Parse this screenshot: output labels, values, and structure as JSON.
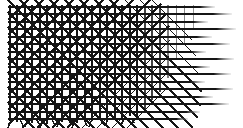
{
  "canvas": {
    "width": 243,
    "height": 128,
    "background_color": "#ffffff",
    "ink_color": "#151515",
    "fade_color": "#8e8e8e",
    "title": "Crosshatch lattice texture"
  },
  "artwork": {
    "type": "abstract-line-texture",
    "description": "Dense woven crosshatch mesh at left that progressively thins toward the right, leaving only horizontal rules that fade to grey; diagonal fringe spikes hang below the bottom edge.",
    "pattern_region": {
      "x": 8,
      "y": 5,
      "width": 228,
      "height": 116
    },
    "grid_pitch": 7.6,
    "stroke_width_heavy": 1.9,
    "stroke_width_light": 1.1,
    "density_gradient": {
      "dense_end_x": 8,
      "sparse_start_x": 120,
      "sparse_end_x": 236
    }
  },
  "chart_data": {
    "type": "line",
    "xlabel": "",
    "ylabel": "",
    "xlim": [
      0,
      243
    ],
    "ylim": [
      0,
      128
    ],
    "grid": false,
    "legend": "none",
    "horizontal_lines": [
      {
        "y": 7,
        "x_start": 8,
        "x_end": 215,
        "weight": 1.9,
        "fade_from": 176
      },
      {
        "y": 14,
        "x_start": 8,
        "x_end": 232,
        "weight": 1.9,
        "fade_from": 182
      },
      {
        "y": 22,
        "x_start": 8,
        "x_end": 208,
        "weight": 1.9,
        "fade_from": 170
      },
      {
        "y": 29,
        "x_start": 8,
        "x_end": 236,
        "weight": 1.9,
        "fade_from": 186
      },
      {
        "y": 37,
        "x_start": 8,
        "x_end": 212,
        "weight": 1.9,
        "fade_from": 172
      },
      {
        "y": 44,
        "x_start": 8,
        "x_end": 230,
        "weight": 1.9,
        "fade_from": 184
      },
      {
        "y": 52,
        "x_start": 8,
        "x_end": 206,
        "weight": 1.9,
        "fade_from": 168
      },
      {
        "y": 59,
        "x_start": 8,
        "x_end": 234,
        "weight": 1.9,
        "fade_from": 188
      },
      {
        "y": 67,
        "x_start": 8,
        "x_end": 210,
        "weight": 1.9,
        "fade_from": 172
      },
      {
        "y": 74,
        "x_start": 8,
        "x_end": 231,
        "weight": 1.9,
        "fade_from": 185
      },
      {
        "y": 82,
        "x_start": 8,
        "x_end": 205,
        "weight": 1.9,
        "fade_from": 166
      },
      {
        "y": 89,
        "x_start": 8,
        "x_end": 233,
        "weight": 1.9,
        "fade_from": 187
      },
      {
        "y": 97,
        "x_start": 8,
        "x_end": 213,
        "weight": 1.9,
        "fade_from": 174
      },
      {
        "y": 104,
        "x_start": 8,
        "x_end": 229,
        "weight": 1.9,
        "fade_from": 183
      },
      {
        "y": 112,
        "x_start": 8,
        "x_end": 200,
        "weight": 1.9,
        "fade_from": 164
      },
      {
        "y": 119,
        "x_start": 8,
        "x_end": 188,
        "weight": 1.9,
        "fade_from": 158
      }
    ],
    "vertical_lines": [
      {
        "x": 10,
        "y_start": 5,
        "y_end": 121,
        "weight": 1.9
      },
      {
        "x": 17,
        "y_start": 5,
        "y_end": 122,
        "weight": 1.9
      },
      {
        "x": 25,
        "y_start": 5,
        "y_end": 120,
        "weight": 1.9
      },
      {
        "x": 32,
        "y_start": 5,
        "y_end": 123,
        "weight": 1.9
      },
      {
        "x": 40,
        "y_start": 5,
        "y_end": 121,
        "weight": 1.9
      },
      {
        "x": 47,
        "y_start": 5,
        "y_end": 124,
        "weight": 1.9
      },
      {
        "x": 55,
        "y_start": 5,
        "y_end": 120,
        "weight": 1.9
      },
      {
        "x": 62,
        "y_start": 5,
        "y_end": 122,
        "weight": 1.9
      },
      {
        "x": 70,
        "y_start": 5,
        "y_end": 119,
        "weight": 1.9
      },
      {
        "x": 77,
        "y_start": 5,
        "y_end": 123,
        "weight": 1.9
      },
      {
        "x": 85,
        "y_start": 5,
        "y_end": 120,
        "weight": 1.9
      },
      {
        "x": 92,
        "y_start": 5,
        "y_end": 121,
        "weight": 1.9
      },
      {
        "x": 100,
        "y_start": 5,
        "y_end": 118,
        "weight": 1.9
      },
      {
        "x": 107,
        "y_start": 5,
        "y_end": 122,
        "weight": 1.9
      },
      {
        "x": 115,
        "y_start": 5,
        "y_end": 119,
        "weight": 1.8
      },
      {
        "x": 122,
        "y_start": 5,
        "y_end": 120,
        "weight": 1.8
      },
      {
        "x": 130,
        "y_start": 5,
        "y_end": 116,
        "weight": 1.6
      },
      {
        "x": 137,
        "y_start": 5,
        "y_end": 118,
        "weight": 1.6
      },
      {
        "x": 145,
        "y_start": 5,
        "y_end": 110,
        "weight": 1.4
      },
      {
        "x": 152,
        "y_start": 5,
        "y_end": 100,
        "weight": 1.3
      },
      {
        "x": 160,
        "y_start": 5,
        "y_end": 92,
        "weight": 1.2
      },
      {
        "x": 168,
        "y_start": 5,
        "y_end": 78,
        "weight": 1.1
      },
      {
        "x": 176,
        "y_start": 5,
        "y_end": 60,
        "weight": 1.0
      },
      {
        "x": 184,
        "y_start": 5,
        "y_end": 44,
        "weight": 0.9
      },
      {
        "x": 193,
        "y_start": 5,
        "y_end": 30,
        "weight": 0.8
      }
    ],
    "diagonal_down_lines": [
      {
        "x_start": 8,
        "y_start": 0,
        "length": 150,
        "weight": 1.8
      },
      {
        "x_start": 8,
        "y_start": 12,
        "length": 150,
        "weight": 1.8
      },
      {
        "x_start": 8,
        "y_start": 27,
        "length": 145,
        "weight": 1.8
      },
      {
        "x_start": 8,
        "y_start": 42,
        "length": 140,
        "weight": 1.8
      },
      {
        "x_start": 8,
        "y_start": 57,
        "length": 130,
        "weight": 1.8
      },
      {
        "x_start": 8,
        "y_start": 72,
        "length": 118,
        "weight": 1.8
      },
      {
        "x_start": 8,
        "y_start": 87,
        "length": 100,
        "weight": 1.8
      },
      {
        "x_start": 8,
        "y_start": 102,
        "length": 78,
        "weight": 1.8
      },
      {
        "x_start": 20,
        "y_start": 0,
        "length": 148,
        "weight": 1.8
      },
      {
        "x_start": 35,
        "y_start": 0,
        "length": 142,
        "weight": 1.8
      },
      {
        "x_start": 50,
        "y_start": 0,
        "length": 135,
        "weight": 1.8
      },
      {
        "x_start": 65,
        "y_start": 0,
        "length": 128,
        "weight": 1.8
      },
      {
        "x_start": 80,
        "y_start": 0,
        "length": 118,
        "weight": 1.7
      },
      {
        "x_start": 95,
        "y_start": 0,
        "length": 106,
        "weight": 1.6
      },
      {
        "x_start": 110,
        "y_start": 0,
        "length": 92,
        "weight": 1.5
      },
      {
        "x_start": 125,
        "y_start": 0,
        "length": 74,
        "weight": 1.4
      },
      {
        "x_start": 140,
        "y_start": 0,
        "length": 56,
        "weight": 1.2
      },
      {
        "x_start": 152,
        "y_start": 0,
        "length": 40,
        "weight": 1.1
      }
    ],
    "diagonal_up_lines": [
      {
        "x_start": 8,
        "y_start": 20,
        "length": 120,
        "weight": 1.7
      },
      {
        "x_start": 8,
        "y_start": 35,
        "length": 125,
        "weight": 1.7
      },
      {
        "x_start": 8,
        "y_start": 50,
        "length": 130,
        "weight": 1.7
      },
      {
        "x_start": 8,
        "y_start": 65,
        "length": 135,
        "weight": 1.7
      },
      {
        "x_start": 8,
        "y_start": 80,
        "length": 138,
        "weight": 1.7
      },
      {
        "x_start": 8,
        "y_start": 95,
        "length": 140,
        "weight": 1.7
      },
      {
        "x_start": 8,
        "y_start": 110,
        "length": 140,
        "weight": 1.7
      },
      {
        "x_start": 8,
        "y_start": 125,
        "length": 138,
        "weight": 1.7
      },
      {
        "x_start": 22,
        "y_start": 128,
        "length": 132,
        "weight": 1.7
      },
      {
        "x_start": 37,
        "y_start": 128,
        "length": 124,
        "weight": 1.6
      },
      {
        "x_start": 52,
        "y_start": 128,
        "length": 114,
        "weight": 1.6
      },
      {
        "x_start": 67,
        "y_start": 128,
        "length": 102,
        "weight": 1.5
      },
      {
        "x_start": 82,
        "y_start": 128,
        "length": 88,
        "weight": 1.4
      },
      {
        "x_start": 97,
        "y_start": 128,
        "length": 72,
        "weight": 1.3
      },
      {
        "x_start": 112,
        "y_start": 128,
        "length": 56,
        "weight": 1.2
      },
      {
        "x_start": 127,
        "y_start": 128,
        "length": 40,
        "weight": 1.1
      }
    ],
    "bottom_fringe": [
      {
        "x": 12,
        "length": 9,
        "lean": -4
      },
      {
        "x": 20,
        "length": 7,
        "lean": 3
      },
      {
        "x": 28,
        "length": 8,
        "lean": -3
      },
      {
        "x": 36,
        "length": 6,
        "lean": 4
      },
      {
        "x": 44,
        "length": 9,
        "lean": -4
      },
      {
        "x": 52,
        "length": 7,
        "lean": 3
      },
      {
        "x": 60,
        "length": 8,
        "lean": -3
      },
      {
        "x": 68,
        "length": 6,
        "lean": 4
      },
      {
        "x": 76,
        "length": 9,
        "lean": -4
      },
      {
        "x": 84,
        "length": 7,
        "lean": 3
      },
      {
        "x": 92,
        "length": 8,
        "lean": -3
      },
      {
        "x": 100,
        "length": 6,
        "lean": 4
      },
      {
        "x": 108,
        "length": 7,
        "lean": -3
      },
      {
        "x": 116,
        "length": 5,
        "lean": 3
      },
      {
        "x": 124,
        "length": 6,
        "lean": -3
      },
      {
        "x": 132,
        "length": 4,
        "lean": 2
      }
    ]
  }
}
